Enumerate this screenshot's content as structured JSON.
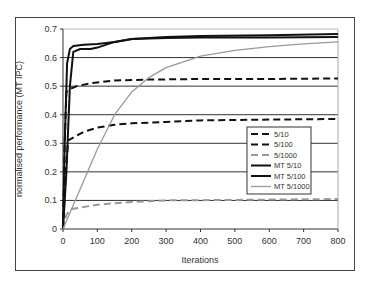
{
  "chart_data": {
    "type": "line",
    "title": "",
    "xlabel": "Iterations",
    "ylabel": "normalised performance (MT IPC)",
    "xlim": [
      0,
      800
    ],
    "ylim": [
      0,
      0.7
    ],
    "xticks": [
      0,
      100,
      200,
      300,
      400,
      500,
      600,
      700,
      800
    ],
    "yticks": [
      0,
      0.1,
      0.2,
      0.3,
      0.4,
      0.5,
      0.6,
      0.7
    ],
    "grid": "horizontal",
    "legend_position": "inside-right",
    "series": [
      {
        "name": "5/10",
        "style": "dashed",
        "color": "#111111",
        "width": 2,
        "x": [
          0,
          5,
          10,
          20,
          40,
          80,
          150,
          250,
          400,
          600,
          800
        ],
        "y": [
          0,
          0.3,
          0.48,
          0.49,
          0.5,
          0.51,
          0.52,
          0.523,
          0.525,
          0.525,
          0.527
        ]
      },
      {
        "name": "5/100",
        "style": "dashed",
        "color": "#111111",
        "width": 2,
        "x": [
          0,
          8,
          15,
          30,
          60,
          100,
          150,
          200,
          300,
          400,
          600,
          800
        ],
        "y": [
          0,
          0.2,
          0.31,
          0.32,
          0.34,
          0.355,
          0.365,
          0.37,
          0.375,
          0.38,
          0.383,
          0.385
        ]
      },
      {
        "name": "5/1000",
        "style": "dashed",
        "color": "#999999",
        "width": 2,
        "x": [
          0,
          10,
          25,
          50,
          100,
          200,
          300,
          500,
          800
        ],
        "y": [
          0,
          0.05,
          0.07,
          0.075,
          0.085,
          0.095,
          0.1,
          0.102,
          0.105
        ]
      },
      {
        "name": "MT 5/10",
        "style": "solid",
        "color": "#111111",
        "width": 2,
        "x": [
          0,
          5,
          12,
          20,
          30,
          60,
          100,
          150,
          200,
          300,
          400,
          600,
          800
        ],
        "y": [
          0,
          0.3,
          0.58,
          0.63,
          0.64,
          0.645,
          0.648,
          0.655,
          0.665,
          0.672,
          0.675,
          0.678,
          0.682
        ]
      },
      {
        "name": "MT 5/100",
        "style": "solid",
        "color": "#111111",
        "width": 2,
        "x": [
          0,
          10,
          20,
          30,
          50,
          80,
          100,
          150,
          200,
          300,
          400,
          600,
          800
        ],
        "y": [
          0,
          0.2,
          0.5,
          0.62,
          0.63,
          0.63,
          0.635,
          0.655,
          0.665,
          0.668,
          0.67,
          0.67,
          0.672
        ]
      },
      {
        "name": "MT 5/1000",
        "style": "solid",
        "color": "#999999",
        "width": 1.3,
        "x": [
          0,
          50,
          100,
          150,
          200,
          250,
          300,
          400,
          500,
          600,
          700,
          800
        ],
        "y": [
          0,
          0.14,
          0.28,
          0.4,
          0.48,
          0.53,
          0.565,
          0.605,
          0.625,
          0.638,
          0.648,
          0.655
        ]
      }
    ]
  }
}
